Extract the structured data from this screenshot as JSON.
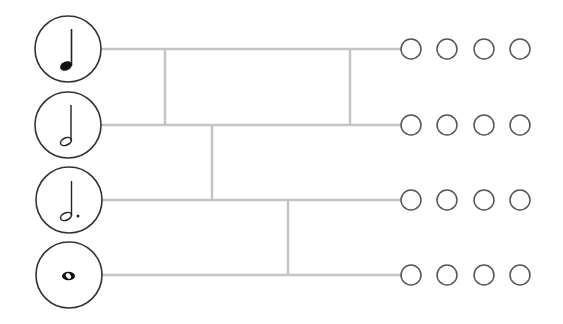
{
  "diagram": {
    "title": "",
    "line_color": "#c4c4c4",
    "circle_stroke": "#333333",
    "notes": [
      {
        "id": "quarter-note",
        "name": "Quarter note",
        "y": 49
      },
      {
        "id": "half-note",
        "name": "Half note",
        "y": 125
      },
      {
        "id": "dotted-half-note",
        "name": "Dotted half note",
        "y": 200
      },
      {
        "id": "whole-note",
        "name": "Whole note",
        "y": 275
      }
    ],
    "answer_circles_per_row": 4,
    "answer_circle_x": [
      411,
      447,
      484,
      520
    ],
    "connectors": [
      {
        "x": 165,
        "from_row": 0,
        "to_row": 1
      },
      {
        "x": 350,
        "from_row": 0,
        "to_row": 1
      },
      {
        "x": 212,
        "from_row": 1,
        "to_row": 2
      },
      {
        "x": 288,
        "from_row": 2,
        "to_row": 3
      }
    ]
  }
}
